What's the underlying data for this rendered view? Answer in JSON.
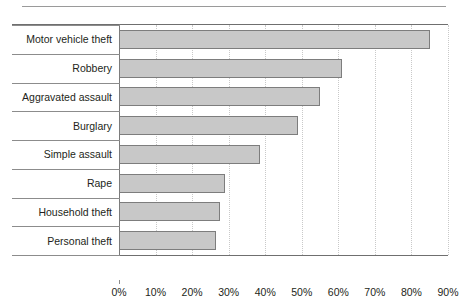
{
  "chart_data": {
    "type": "bar",
    "orientation": "horizontal",
    "title": "",
    "subtitle": "",
    "xlabel": "",
    "ylabel": "",
    "categories": [
      "Motor vehicle theft",
      "Robbery",
      "Aggravated assault",
      "Burglary",
      "Simple assault",
      "Rape",
      "Household theft",
      "Personal theft"
    ],
    "values": [
      85,
      61,
      55,
      49,
      38.5,
      29,
      27.5,
      26.5
    ],
    "value_unit": "%",
    "xlim": [
      0,
      90
    ],
    "xtick_values": [
      0,
      10,
      20,
      30,
      40,
      50,
      60,
      70,
      80,
      90
    ],
    "xtick_labels": [
      "0%",
      "10%",
      "20%",
      "30%",
      "40%",
      "50%",
      "60%",
      "70%",
      "80%",
      "90%"
    ],
    "grid": "vertical-dotted",
    "legend": "none",
    "legend_position": "none",
    "bar_fill_color": "#c8c8c8",
    "bar_border_color": "#7d7d7d",
    "axis_color": "#6f6f6f",
    "gridline_color": "#c9c9c9",
    "text_color": "#231f20"
  }
}
